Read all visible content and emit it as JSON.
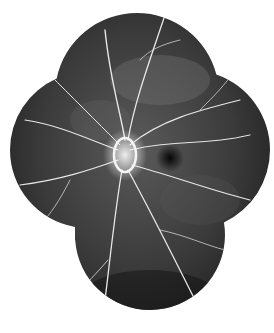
{
  "image": {
    "description": "Fluorescein angiography retinal montage, grayscale, cloverleaf composite of five fields",
    "colors": {
      "background": "#ffffff",
      "fundus_dark": "#1a1a1a",
      "fundus_mid": "#3a3a3a",
      "vessel": "#e8e8e8",
      "disc": "#f5f5f5"
    },
    "fields": [
      {
        "name": "top",
        "cx": 137,
        "cy": 95,
        "r": 82
      },
      {
        "name": "left",
        "cx": 88,
        "cy": 150,
        "r": 78
      },
      {
        "name": "right",
        "cx": 188,
        "cy": 150,
        "r": 80
      },
      {
        "name": "center",
        "cx": 140,
        "cy": 160,
        "r": 85
      },
      {
        "name": "bottom",
        "cx": 148,
        "cy": 235,
        "r": 75
      }
    ],
    "optic_disc": {
      "cx": 125,
      "cy": 155,
      "rx": 13,
      "ry": 18
    },
    "fovea": {
      "cx": 170,
      "cy": 158,
      "r": 12
    }
  }
}
